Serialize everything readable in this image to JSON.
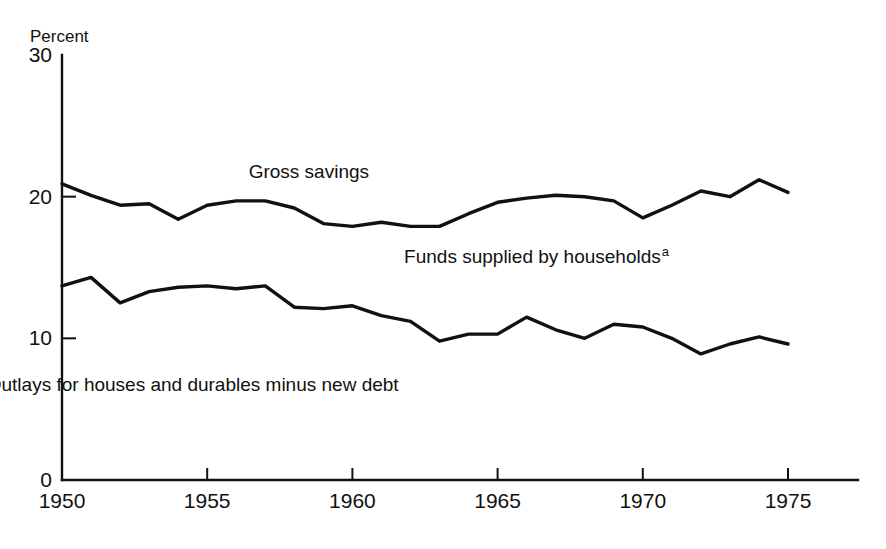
{
  "chart_data": {
    "type": "line",
    "title": "",
    "xlabel": "",
    "ylabel": "Percent",
    "xlim": [
      1950,
      1975
    ],
    "ylim": [
      0,
      30
    ],
    "grid": false,
    "legend_position": "inline-labels",
    "x_ticks": [
      "1950",
      "1955",
      "1960",
      "1965",
      "1970",
      "1975"
    ],
    "x_tick_values": [
      1950,
      1955,
      1960,
      1965,
      1970,
      1975
    ],
    "y_ticks": [
      "0",
      "10",
      "20",
      "30"
    ],
    "y_tick_values": [
      0,
      10,
      20,
      30
    ],
    "x": [
      1950,
      1951,
      1952,
      1953,
      1954,
      1955,
      1956,
      1957,
      1958,
      1959,
      1960,
      1961,
      1962,
      1963,
      1964,
      1965,
      1966,
      1967,
      1968,
      1969,
      1970,
      1971,
      1972,
      1973,
      1974,
      1975
    ],
    "series": [
      {
        "name": "Gross savings",
        "label": "Gross savings",
        "label_x": 1958.5,
        "label_y": 21.3,
        "color": "#111111",
        "values": [
          20.9,
          20.1,
          19.4,
          19.5,
          18.4,
          19.4,
          19.7,
          19.7,
          19.2,
          18.1,
          17.9,
          18.2,
          17.9,
          17.9,
          18.8,
          19.6,
          19.9,
          20.1,
          20.0,
          19.7,
          18.5,
          19.4,
          20.4,
          20.0,
          21.2,
          20.3
        ]
      },
      {
        "name": "Outlays for houses and durables minus new debt",
        "label": "Outlays for houses and durables minus new debt",
        "label_x": 1954.5,
        "label_y": 6.3,
        "color": "#111111",
        "values": [
          13.7,
          14.3,
          12.5,
          13.3,
          13.6,
          13.7,
          13.5,
          13.7,
          12.2,
          12.1,
          12.3,
          11.6,
          11.2,
          9.8,
          10.3,
          10.3,
          11.5,
          10.6,
          10.0,
          11.0,
          10.8,
          10.0,
          8.9,
          9.6,
          10.1,
          9.6
        ]
      }
    ],
    "annotations": [
      {
        "name": "funds-supplied-by-households",
        "text": "Funds supplied by households",
        "footnote_mark": "a",
        "x": 1966.2,
        "y": 15.3
      }
    ]
  }
}
